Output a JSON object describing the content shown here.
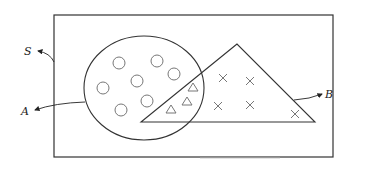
{
  "diagram": {
    "labels": {
      "universal": "S",
      "set_a": "A",
      "set_b": "B"
    },
    "set_a_shape": "ellipse",
    "set_b_shape": "triangle",
    "set_a_only_elements": {
      "symbol": "circle",
      "count": 8
    },
    "intersection_elements": {
      "symbol": "triangle",
      "count": 3
    },
    "set_b_only_elements": {
      "symbol": "cross",
      "count": 5
    },
    "colors": {
      "outline": "#333333",
      "element": "#777777",
      "background": "#ffffff"
    }
  }
}
